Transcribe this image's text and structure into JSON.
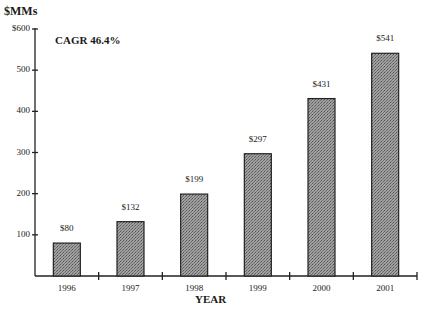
{
  "chart_data": {
    "type": "bar",
    "title": "",
    "unit_label": "$MMs",
    "annotation": "CAGR 46.4%",
    "xlabel": "YEAR",
    "ylabel": "$MMs",
    "categories": [
      "1996",
      "1997",
      "1998",
      "1999",
      "2000",
      "2001"
    ],
    "values": [
      80,
      132,
      199,
      297,
      431,
      541
    ],
    "value_labels": [
      "$80",
      "$132",
      "$199",
      "$297",
      "$431",
      "$541"
    ],
    "ylim": [
      0,
      600
    ],
    "yticks": [
      100,
      200,
      300,
      400,
      500,
      600
    ],
    "ytick_labels": [
      "100",
      "200",
      "300",
      "400",
      "500",
      "$600"
    ],
    "grid": false,
    "legend": null,
    "bar_color": "#8c8c8c",
    "bar_pattern": "stippled"
  }
}
